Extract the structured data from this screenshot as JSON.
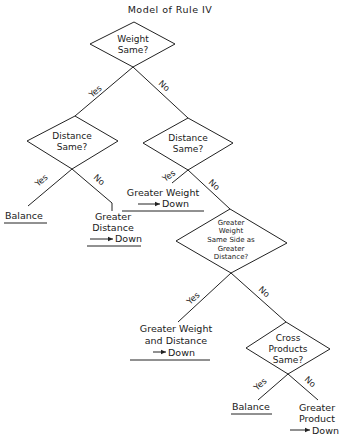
{
  "title": "Model of Rule IV",
  "nodes": {
    "weight_same": {
      "lines": [
        "Weight",
        "Same?"
      ]
    },
    "distance_same_left": {
      "lines": [
        "Distance",
        "Same?"
      ]
    },
    "distance_same_right": {
      "lines": [
        "Distance",
        "Same?"
      ]
    },
    "greater_weight_same_side": {
      "lines": [
        "Greater",
        "Weight",
        "Same Side as",
        "Greater",
        "Distance?"
      ]
    },
    "cross_products_same": {
      "lines": [
        "Cross",
        "Products",
        "Same?"
      ]
    }
  },
  "edge_labels": {
    "yes": "Yes",
    "no": "No"
  },
  "outcomes": {
    "balance_1": {
      "lines": [
        "Balance"
      ]
    },
    "greater_distance_down": {
      "lines": [
        "Greater",
        "Distance",
        "Down"
      ]
    },
    "greater_weight_down": {
      "lines": [
        "Greater Weight",
        "Down"
      ]
    },
    "greater_weight_distance_down": {
      "lines": [
        "Greater Weight",
        "and Distance",
        "Down"
      ]
    },
    "balance_2": {
      "lines": [
        "Balance"
      ]
    },
    "greater_product_down": {
      "lines": [
        "Greater",
        "Product",
        "Down"
      ]
    }
  },
  "arrow_glyph": "→"
}
